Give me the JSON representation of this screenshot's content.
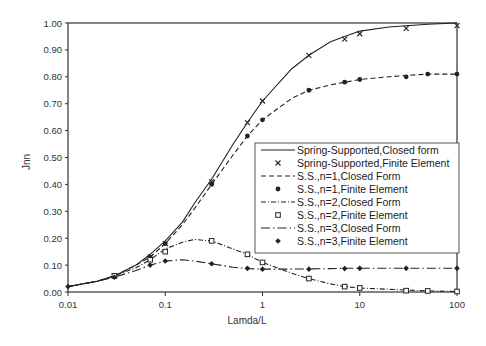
{
  "chart_data": {
    "type": "line",
    "title": "",
    "xlabel": "Lamda/L",
    "ylabel": "Jnn",
    "xscale": "log",
    "xlim": [
      0.01,
      100
    ],
    "ylim": [
      0.0,
      1.0
    ],
    "xticks": [
      "0.01",
      "0.1",
      "1",
      "10",
      "100"
    ],
    "yticks": [
      "0.00",
      "0.10",
      "0.20",
      "0.30",
      "0.40",
      "0.50",
      "0.60",
      "0.70",
      "0.80",
      "0.90",
      "1.00"
    ],
    "grid": false,
    "legend_position": "lower right (inside)",
    "series": [
      {
        "name": "Spring-Supported,Closed form",
        "style": "solid",
        "marker": "none",
        "x": [
          0.01,
          0.02,
          0.03,
          0.05,
          0.07,
          0.1,
          0.15,
          0.2,
          0.3,
          0.5,
          0.7,
          1,
          2,
          3,
          5,
          7,
          10,
          20,
          30,
          50,
          100
        ],
        "y": [
          0.02,
          0.04,
          0.06,
          0.1,
          0.14,
          0.19,
          0.26,
          0.33,
          0.42,
          0.55,
          0.63,
          0.71,
          0.83,
          0.88,
          0.93,
          0.95,
          0.97,
          0.985,
          0.99,
          0.995,
          1.0
        ]
      },
      {
        "name": "Spring-Supported,Finite Element",
        "style": "none",
        "marker": "x",
        "x": [
          0.03,
          0.07,
          0.1,
          0.3,
          0.7,
          1,
          3,
          7,
          10,
          30,
          100
        ],
        "y": [
          0.06,
          0.13,
          0.18,
          0.41,
          0.63,
          0.71,
          0.88,
          0.94,
          0.96,
          0.98,
          0.99
        ]
      },
      {
        "name": "S.S.,n=1,Closed Form",
        "style": "dashed",
        "marker": "none",
        "x": [
          0.01,
          0.02,
          0.03,
          0.05,
          0.07,
          0.1,
          0.15,
          0.2,
          0.3,
          0.5,
          0.7,
          1,
          2,
          3,
          5,
          7,
          10,
          20,
          30,
          50,
          100
        ],
        "y": [
          0.02,
          0.04,
          0.06,
          0.1,
          0.13,
          0.18,
          0.25,
          0.31,
          0.4,
          0.51,
          0.58,
          0.64,
          0.72,
          0.75,
          0.77,
          0.78,
          0.79,
          0.8,
          0.805,
          0.81,
          0.81
        ]
      },
      {
        "name": "S.S.,n=1,Finite Element",
        "style": "none",
        "marker": "filled-circle",
        "x": [
          0.03,
          0.07,
          0.1,
          0.3,
          0.7,
          1,
          3,
          7,
          10,
          30,
          50,
          100
        ],
        "y": [
          0.06,
          0.13,
          0.18,
          0.4,
          0.58,
          0.64,
          0.75,
          0.78,
          0.79,
          0.8,
          0.81,
          0.81
        ]
      },
      {
        "name": "S.S.,n=2,Closed Form",
        "style": "dash-dot",
        "marker": "none",
        "x": [
          0.01,
          0.02,
          0.03,
          0.05,
          0.07,
          0.1,
          0.15,
          0.2,
          0.3,
          0.5,
          0.7,
          1,
          2,
          3,
          5,
          7,
          10,
          20,
          30,
          50,
          100
        ],
        "y": [
          0.02,
          0.04,
          0.06,
          0.09,
          0.12,
          0.16,
          0.185,
          0.195,
          0.19,
          0.16,
          0.14,
          0.11,
          0.07,
          0.05,
          0.03,
          0.02,
          0.015,
          0.01,
          0.007,
          0.004,
          0.002
        ]
      },
      {
        "name": "S.S.,n=2,Finite Element",
        "style": "none",
        "marker": "open-square",
        "x": [
          0.03,
          0.07,
          0.1,
          0.3,
          0.7,
          1,
          3,
          7,
          10,
          30,
          50,
          100
        ],
        "y": [
          0.06,
          0.12,
          0.15,
          0.19,
          0.14,
          0.11,
          0.05,
          0.02,
          0.015,
          0.005,
          0.004,
          0.002
        ]
      },
      {
        "name": "S.S.,n=3,Closed Form",
        "style": "long-dash-dot",
        "marker": "none",
        "x": [
          0.01,
          0.02,
          0.03,
          0.05,
          0.07,
          0.1,
          0.15,
          0.2,
          0.3,
          0.5,
          0.7,
          1,
          2,
          3,
          5,
          7,
          10,
          20,
          30,
          50,
          100
        ],
        "y": [
          0.02,
          0.04,
          0.055,
          0.08,
          0.1,
          0.115,
          0.12,
          0.115,
          0.105,
          0.092,
          0.087,
          0.085,
          0.085,
          0.086,
          0.087,
          0.088,
          0.088,
          0.088,
          0.088,
          0.088,
          0.088
        ]
      },
      {
        "name": "S.S.,n=3,Finite Element",
        "style": "none",
        "marker": "filled-diamond",
        "x": [
          0.01,
          0.03,
          0.07,
          0.1,
          0.3,
          0.7,
          1,
          3,
          7,
          10,
          30,
          100
        ],
        "y": [
          0.02,
          0.055,
          0.1,
          0.115,
          0.105,
          0.088,
          0.085,
          0.085,
          0.087,
          0.088,
          0.088,
          0.088
        ]
      }
    ]
  },
  "axes": {
    "xlabel": "Lamda/L",
    "ylabel": "Jnn"
  },
  "legend": [
    {
      "label": "Spring-Supported,Closed form"
    },
    {
      "label": "Spring-Supported,Finite Element"
    },
    {
      "label": "S.S.,n=1,Closed Form"
    },
    {
      "label": "S.S.,n=1,Finite Element"
    },
    {
      "label": "S.S.,n=2,Closed Form"
    },
    {
      "label": "S.S.,n=2,Finite Element"
    },
    {
      "label": "S.S.,n=3,Closed Form"
    },
    {
      "label": "S.S.,n=3,Finite Element"
    }
  ]
}
